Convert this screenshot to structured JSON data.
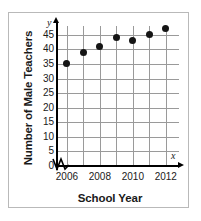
{
  "chart_data": {
    "type": "scatter",
    "title": "",
    "xlabel": "School Year",
    "ylabel": "Number of Male Teachers",
    "x": [
      2006,
      2007,
      2008,
      2009,
      2010,
      2011,
      2012
    ],
    "values": [
      35,
      39,
      41,
      44,
      43,
      45,
      47
    ],
    "points": [
      {
        "x": 2006,
        "y": 35
      },
      {
        "x": 2007,
        "y": 39
      },
      {
        "x": 2008,
        "y": 41
      },
      {
        "x": 2009,
        "y": 44
      },
      {
        "x": 2010,
        "y": 43
      },
      {
        "x": 2011,
        "y": 45
      },
      {
        "x": 2012,
        "y": 47
      }
    ],
    "ylim": [
      0,
      48
    ],
    "xlim": [
      2005.4,
      2012.8
    ],
    "yticks": [
      0,
      5,
      10,
      15,
      20,
      25,
      30,
      35,
      40,
      45
    ],
    "ytick_labels": [
      "0",
      "5",
      "10",
      "15",
      "20",
      "25",
      "30",
      "35",
      "40",
      "45"
    ],
    "xticks": [
      2006,
      2008,
      2010,
      2012
    ],
    "xtick_labels": [
      "2006",
      "2008",
      "2010",
      "2012"
    ],
    "x_gridlines": [
      2006,
      2007,
      2008,
      2009,
      2010,
      2011,
      2012
    ],
    "grid": true,
    "legend": false,
    "axis_break_x": true,
    "axis_letters": {
      "y": "y",
      "x": "x"
    },
    "colors": {
      "marker": "#151515",
      "gridline": "#9a9a9a",
      "axis": "#000000",
      "frame": "#b9b9b9",
      "text": "#1a1a1a",
      "background": "#ffffff"
    }
  }
}
